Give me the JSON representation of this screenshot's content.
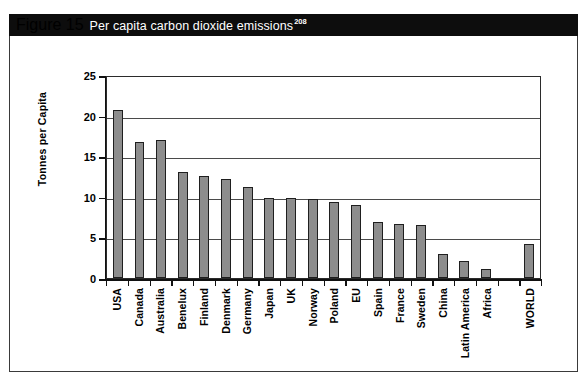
{
  "figure": {
    "number": "Figure 15",
    "caption": "Per capita carbon dioxide emissions",
    "footnote": "208"
  },
  "chart_data": {
    "type": "bar",
    "title": "Per capita carbon dioxide emissions",
    "xlabel": "",
    "ylabel": "Tonnes per Capita",
    "ylim": [
      0,
      25
    ],
    "yticks": [
      "0",
      "5",
      "10",
      "15",
      "20",
      "25"
    ],
    "ytick_values": [
      0,
      5,
      10,
      15,
      20,
      25
    ],
    "grid": true,
    "legend": "none",
    "categories": [
      "USA",
      "Canada",
      "Australia",
      "Benelux",
      "Finland",
      "Denmark",
      "Germany",
      "Japan",
      "UK",
      "Norway",
      "Poland",
      "EU",
      "Spain",
      "France",
      "Sweden",
      "China",
      "Latin America",
      "Africa",
      "",
      "WORLD"
    ],
    "values": [
      20.7,
      16.8,
      17.0,
      13.1,
      12.6,
      12.2,
      11.2,
      9.9,
      9.8,
      9.7,
      9.4,
      9.0,
      6.9,
      6.6,
      6.5,
      2.9,
      2.1,
      1.1,
      null,
      4.2
    ],
    "bar_color": "#8d8d8d",
    "bar_edge_color": "#1f1f1f",
    "axis_color": "#111111",
    "grid_color": "#4a4a4a",
    "header_color": "#0d0d0d"
  }
}
